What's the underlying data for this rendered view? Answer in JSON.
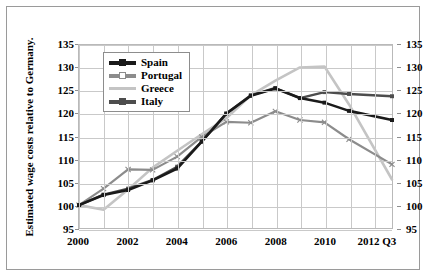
{
  "axes": {
    "y_title": "Estimated wage costs relative to Germany.",
    "y_ticks": [
      "135",
      "130",
      "125",
      "120",
      "115",
      "110",
      "105",
      "100",
      "95"
    ],
    "x_ticks": [
      "2000",
      "2002",
      "2004",
      "2006",
      "2008",
      "2010",
      "2012 Q3"
    ]
  },
  "legend": {
    "items": [
      {
        "label": "Spain",
        "color": "#1a1a1a"
      },
      {
        "label": "Portugal",
        "color": "#8c8c8c"
      },
      {
        "label": "Greece",
        "color": "#c4c4c4"
      },
      {
        "label": "Italy",
        "color": "#4d4d4d"
      }
    ]
  },
  "chart_data": {
    "type": "line",
    "title": "",
    "xlabel": "",
    "ylabel": "Estimated wage costs relative to Germany.",
    "xlim": [
      2000,
      2012.75
    ],
    "ylim": [
      95,
      135
    ],
    "ytick_step": 5,
    "grid": true,
    "legend_position": "upper-left-inside",
    "x": [
      2000,
      2001,
      2002,
      2003,
      2004,
      2005,
      2006,
      2007,
      2008,
      2009,
      2010,
      2011,
      2012.75
    ],
    "x_labels": [
      "2000",
      "2001",
      "2002",
      "2003",
      "2004",
      "2005",
      "2006",
      "2007",
      "2008",
      "2009",
      "2010",
      "2011",
      "2012 Q3"
    ],
    "series": [
      {
        "name": "Spain",
        "color": "#1a1a1a",
        "values": [
          100.0,
          102.2,
          103.3,
          105.4,
          108.0,
          113.9,
          120.0,
          123.9,
          125.5,
          123.4,
          122.4,
          120.6,
          118.6
        ]
      },
      {
        "name": "Portugal",
        "color": "#8c8c8c",
        "values": [
          100.0,
          103.6,
          107.8,
          107.7,
          110.6,
          114.9,
          118.2,
          118.0,
          120.5,
          118.6,
          118.1,
          114.4,
          108.9
        ]
      },
      {
        "name": "Greece",
        "color": "#c4c4c4",
        "values": [
          100.0,
          99.0,
          103.4,
          108.2,
          111.9,
          115.5,
          119.0,
          124.0,
          127.2,
          130.1,
          130.3,
          122.0,
          105.6
        ]
      },
      {
        "name": "Italy",
        "color": "#4d4d4d",
        "values": [
          100.0,
          102.3,
          103.6,
          105.5,
          108.4,
          113.9,
          120.0,
          124.0,
          125.6,
          123.4,
          124.7,
          124.3,
          123.8
        ]
      }
    ]
  }
}
